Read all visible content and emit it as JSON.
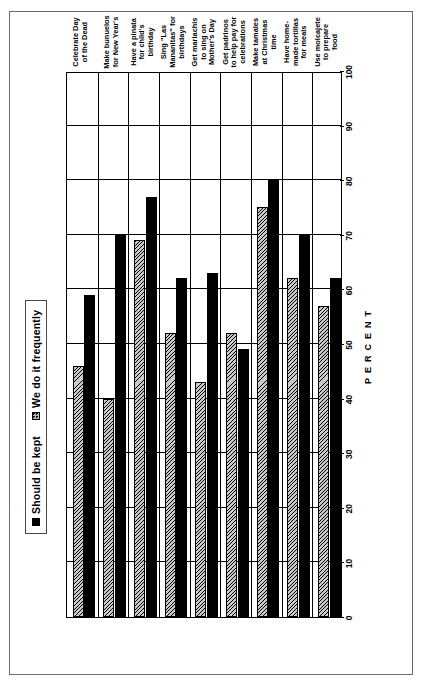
{
  "chart_data": {
    "type": "bar",
    "orientation": "horizontal",
    "title": "",
    "xlabel": "PERCENT",
    "ylabel": "",
    "xlim": [
      0,
      100
    ],
    "xticks": [
      0,
      10,
      20,
      30,
      40,
      50,
      60,
      70,
      80,
      90,
      100
    ],
    "grid": true,
    "legend_position": "top",
    "categories": [
      "Celebrate Day of the Dead",
      "Make bunuelos for New Year's",
      "Have a pinata for child's birthday",
      "Sing \"Las Mananitas\" for birthdays",
      "Get mariachis to sing on Mother's Day",
      "Get padrinos to help pay for celebrations",
      "Make tamales at Christmas time",
      "Have home-made tortillas for meals",
      "Use molcajete to prepare food"
    ],
    "series": [
      {
        "name": "Should be kept",
        "swatch": "solid-black",
        "color": "#000000",
        "values": [
          59,
          70,
          77,
          62,
          63,
          49,
          80,
          70,
          62
        ]
      },
      {
        "name": "We do it frequently",
        "swatch": "hatched-gray",
        "color": "#c9c9c9",
        "values": [
          46,
          40,
          69,
          52,
          43,
          52,
          75,
          62,
          57
        ]
      }
    ]
  },
  "legend": {
    "items": [
      {
        "label": "Should be kept"
      },
      {
        "label": "We do it frequently"
      }
    ]
  },
  "axis": {
    "title": "PERCENT",
    "ticks": [
      "100",
      "90",
      "80",
      "70",
      "60",
      "50",
      "40",
      "30",
      "20",
      "10",
      "0"
    ]
  },
  "category_label_lines": [
    [
      "Celebrate Day",
      "of the Dead"
    ],
    [
      "Make bunuelos",
      "for New Year's"
    ],
    [
      "Have a pinata",
      "for child's",
      "birthday"
    ],
    [
      "Sing \"Las",
      "Mananitas\" for",
      "birthdays"
    ],
    [
      "Get mariachis",
      "to sing on",
      "Mother's Day"
    ],
    [
      "Get padrinos",
      "to help pay for",
      "celebrations"
    ],
    [
      "Make tamales",
      "at Christmas",
      "time"
    ],
    [
      "Have home-",
      "made tortillas",
      "for meals"
    ],
    [
      "Use molcajete",
      "to prepare",
      "food"
    ]
  ]
}
